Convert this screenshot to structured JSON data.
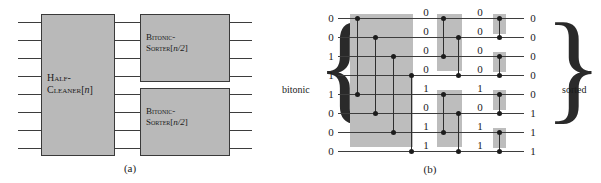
{
  "figure": {
    "panel_a": {
      "caption": "(a)",
      "blocks": [
        {
          "id": "half-cleaner",
          "line1": "Half-",
          "line2": "Cleaner[",
          "param": "n",
          "close": "]"
        },
        {
          "id": "bitonic-sorter-top",
          "line1": "Bitonic-",
          "line2": "Sorter[",
          "param": "n/2",
          "close": "]"
        },
        {
          "id": "bitonic-sorter-bottom",
          "line1": "Bitonic-",
          "line2": "Sorter[",
          "param": "n/2",
          "close": "]"
        }
      ]
    },
    "panel_b": {
      "caption": "(b)",
      "left_label": "bitonic",
      "right_label": "sorted",
      "left_brace": "{",
      "right_brace": "}",
      "wire_count": 8,
      "columns": {
        "input": [
          "0",
          "0",
          "1",
          "1",
          "1",
          "0",
          "0",
          "0"
        ],
        "after_stage1": [
          "0",
          "0",
          "0",
          "0",
          "1",
          "0",
          "1",
          "1"
        ],
        "after_stage2": [
          "0",
          "0",
          "0",
          "0",
          "1",
          "0",
          "1",
          "1"
        ],
        "output": [
          "0",
          "0",
          "0",
          "0",
          "0",
          "1",
          "1",
          "1"
        ]
      },
      "stages": [
        {
          "name": "half-cleaner-stage",
          "span": 4,
          "comparators": [
            {
              "top_wire": 0,
              "bottom_wire": 4
            },
            {
              "top_wire": 1,
              "bottom_wire": 5
            },
            {
              "top_wire": 2,
              "bottom_wire": 6
            },
            {
              "top_wire": 3,
              "bottom_wire": 7
            }
          ]
        },
        {
          "name": "half-size-stage",
          "span": 2,
          "comparators": [
            {
              "top_wire": 0,
              "bottom_wire": 2
            },
            {
              "top_wire": 1,
              "bottom_wire": 3
            },
            {
              "top_wire": 4,
              "bottom_wire": 6
            },
            {
              "top_wire": 5,
              "bottom_wire": 7
            }
          ]
        },
        {
          "name": "final-stage",
          "span": 1,
          "comparators": [
            {
              "top_wire": 0,
              "bottom_wire": 1
            },
            {
              "top_wire": 2,
              "bottom_wire": 3
            },
            {
              "top_wire": 4,
              "bottom_wire": 5
            },
            {
              "top_wire": 6,
              "bottom_wire": 7
            }
          ]
        }
      ]
    }
  },
  "colors": {
    "block_fill": "#b9b9b9",
    "shade_fill": "#bdbdbd",
    "line": "#3d3d3d",
    "dot": "#1c1c1c",
    "text": "#1b1b1b",
    "background": "#ffffff"
  }
}
